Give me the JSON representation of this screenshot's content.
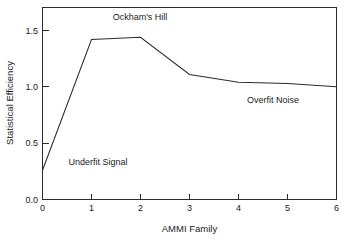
{
  "chart_data": {
    "type": "line",
    "title": "",
    "xlabel": "AMMI Family",
    "ylabel": "Statistical Efficiency",
    "xlim": [
      0,
      6
    ],
    "ylim": [
      0.0,
      1.7
    ],
    "grid": false,
    "legend": "none",
    "x": [
      0,
      1,
      2,
      3,
      4,
      5,
      6
    ],
    "values": [
      0.26,
      1.42,
      1.44,
      1.11,
      1.04,
      1.03,
      1.0
    ],
    "series": [
      {
        "name": "Statistical Efficiency",
        "values": [
          0.26,
          1.42,
          1.44,
          1.11,
          1.04,
          1.03,
          1.0
        ]
      }
    ],
    "x_ticks": [
      "0",
      "1",
      "2",
      "3",
      "4",
      "5",
      "6"
    ],
    "x_tick_values": [
      0,
      1,
      2,
      3,
      4,
      5,
      6
    ],
    "y_ticks": [
      "0.0",
      "0.5",
      "1.0",
      "1.5"
    ],
    "y_tick_values": [
      0.0,
      0.5,
      1.0,
      1.5
    ],
    "annotations": [
      {
        "text": "Ockham's Hill",
        "x": 2.0,
        "y": 1.62
      },
      {
        "text": "Underfit Signal",
        "x": 1.1,
        "y": 0.42
      },
      {
        "text": "Overfit Noise",
        "x": 4.7,
        "y": 0.8
      }
    ],
    "line_color": "#2b2b2b",
    "axis_color": "#2b2b2b",
    "background_color": "#ffffff"
  }
}
